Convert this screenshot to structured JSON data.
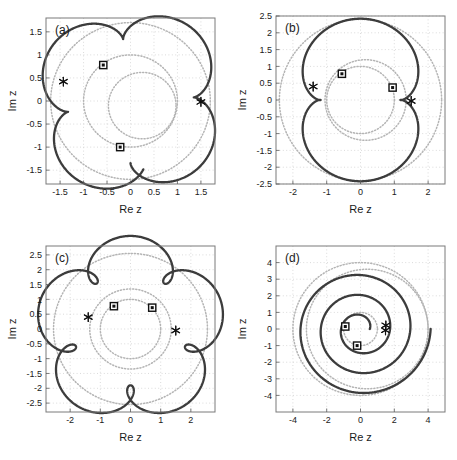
{
  "figure": {
    "width": 457,
    "height": 460,
    "background": "#ffffff",
    "curve_color": "#3c3c3c",
    "guide_color": "#b4b4b4",
    "grid_color": "#cccccc",
    "frame_color": "#7a7a7a",
    "marker_color": "#111111"
  },
  "chart_data": {
    "type": "line",
    "title": "",
    "shared": {
      "xlabel": "Re z",
      "ylabel": "Im z",
      "grid": true,
      "legend": false
    },
    "panels": [
      {
        "id": "a",
        "label": "(a)",
        "xlabel": "Re z",
        "ylabel": "Im z",
        "xlim": [
          -1.8,
          1.8
        ],
        "ylim": [
          -1.8,
          1.8
        ],
        "xticks": [
          -1.5,
          -1,
          -0.5,
          0,
          0.5,
          1,
          1.5
        ],
        "xticklabels": [
          "-1.5",
          "-1",
          "-0.5",
          "0",
          "0.5",
          "1",
          "1.5"
        ],
        "yticks": [
          -1.5,
          -1,
          -0.5,
          0,
          0.5,
          1,
          1.5
        ],
        "yticklabels": [
          "-1.5",
          "-1",
          "-0.5",
          "0",
          "0.5",
          "1",
          "1.5"
        ],
        "curve": {
          "form": "epitrochoid",
          "R": 1.35,
          "r": 0.35,
          "d": 0.35,
          "rotation_deg": -90,
          "center": [
            0.0,
            0.0
          ],
          "turns": 1,
          "cusps": 1,
          "max_radius": 1.7
        },
        "guides": [
          {
            "center": [
              0.0,
              0.0
            ],
            "radius": 1.7
          },
          {
            "center": [
              0.0,
              0.0
            ],
            "radius": 1.0
          },
          {
            "center": [
              0.25,
              -0.1
            ],
            "radius": 0.72
          }
        ],
        "squares": [
          [
            -0.58,
            0.78
          ],
          [
            -0.22,
            -1.0
          ]
        ],
        "stars": [
          [
            -1.43,
            0.42
          ],
          [
            1.5,
            -0.02
          ]
        ]
      },
      {
        "id": "b",
        "label": "(b)",
        "xlabel": "Re z",
        "ylabel": "Im z",
        "xlim": [
          -2.5,
          2.5
        ],
        "ylim": [
          -2.5,
          2.5
        ],
        "xticks": [
          -2,
          -1,
          0,
          1,
          2
        ],
        "xticklabels": [
          "-2",
          "-1",
          "0",
          "1",
          "2"
        ],
        "yticks": [
          -2.5,
          -2,
          -1.5,
          -1,
          -0.5,
          0,
          0.5,
          1,
          1.5,
          2,
          2.5
        ],
        "yticklabels": [
          "-2.5",
          "-2",
          "-1.5",
          "-1",
          "-0.5",
          "0",
          "0.5",
          "1",
          "1.5",
          "2",
          "2.5"
        ],
        "curve": {
          "form": "epitrochoid",
          "R": 1.2,
          "r": 0.6,
          "d": 0.62,
          "rotation_deg": 180,
          "center": [
            0.0,
            0.0
          ],
          "turns": 1,
          "cusps": 2,
          "max_radius": 2.4
        },
        "guides": [
          {
            "center": [
              0.0,
              0.0
            ],
            "radius": 2.4
          },
          {
            "center": [
              0.0,
              0.0
            ],
            "radius": 1.0
          },
          {
            "center": [
              0.15,
              0.0
            ],
            "radius": 1.2
          }
        ],
        "squares": [
          [
            -0.55,
            0.78
          ],
          [
            0.95,
            0.37
          ]
        ],
        "stars": [
          [
            -1.4,
            0.4
          ],
          [
            1.5,
            -0.03
          ]
        ]
      },
      {
        "id": "c",
        "label": "(c)",
        "xlabel": "Re z",
        "ylabel": "Im z",
        "xlim": [
          -2.8,
          2.8
        ],
        "ylim": [
          -2.8,
          2.8
        ],
        "xticks": [
          -2,
          -1,
          0,
          1,
          2
        ],
        "xticklabels": [
          "-2",
          "-1",
          "0",
          "1",
          "2"
        ],
        "yticks": [
          -2.5,
          -2,
          -1.5,
          -1,
          -0.5,
          0,
          0.5,
          1,
          1.5,
          2,
          2.5
        ],
        "yticklabels": [
          "-2.5",
          "-2",
          "-1.5",
          "-1",
          "-0.5",
          "0",
          "0.5",
          "1",
          "1.5",
          "2",
          "2.5"
        ],
        "curve": {
          "form": "epitrochoid-looped",
          "R": 2.1,
          "r": 0.42,
          "d": 0.62,
          "rotation_deg": 198,
          "center": [
            0.0,
            0.0
          ],
          "turns": 1,
          "loops": 5,
          "max_radius": 2.65
        },
        "guides": [
          {
            "center": [
              0.0,
              0.0
            ],
            "radius": 2.55
          },
          {
            "center": [
              0.0,
              0.0
            ],
            "radius": 1.0
          },
          {
            "center": [
              0.0,
              0.0
            ],
            "radius": 1.35
          }
        ],
        "squares": [
          [
            -0.55,
            0.77
          ],
          [
            0.72,
            0.72
          ]
        ],
        "stars": [
          [
            -1.4,
            0.4
          ],
          [
            1.5,
            -0.05
          ]
        ]
      },
      {
        "id": "d",
        "label": "(d)",
        "xlabel": "Re z",
        "ylabel": "Im z",
        "xlim": [
          -5,
          5
        ],
        "ylim": [
          -5,
          5
        ],
        "xticks": [
          -4,
          -2,
          0,
          2,
          4
        ],
        "xticklabels": [
          "-4",
          "-2",
          "0",
          "2",
          "4"
        ],
        "yticks": [
          -4,
          -3,
          -2,
          -1,
          0,
          1,
          2,
          3,
          4
        ],
        "yticklabels": [
          "-4",
          "-3",
          "-2",
          "-1",
          "0",
          "1",
          "2",
          "3",
          "4"
        ],
        "curve": {
          "form": "spiral",
          "r_start": 0.55,
          "r_end": 4.15,
          "theta_start_deg": 0,
          "theta_total_deg": 1080,
          "center": [
            0.0,
            0.0
          ],
          "turns": 3,
          "max_radius": 4.15
        },
        "guides": [
          {
            "center": [
              0.0,
              0.0
            ],
            "radius": 4.0
          },
          {
            "center": [
              0.0,
              0.0
            ],
            "radius": 1.0
          },
          {
            "center": [
              0.4,
              0.0
            ],
            "radius": 3.6
          }
        ],
        "squares": [
          [
            -0.9,
            0.15
          ],
          [
            -0.2,
            -1.0
          ]
        ],
        "stars": [
          [
            1.5,
            0.22
          ],
          [
            1.48,
            -0.08
          ]
        ]
      }
    ]
  }
}
